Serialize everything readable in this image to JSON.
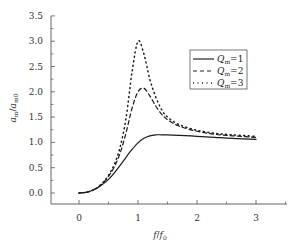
{
  "chart_data": {
    "type": "line",
    "title": "",
    "xlabel": "f/f0",
    "ylabel": "a_m/a_m0",
    "xlim": [
      -0.45,
      3.5
    ],
    "ylim": [
      -0.22,
      3.5
    ],
    "x_ticks": [
      0,
      1,
      2,
      3
    ],
    "x_tick_labels": [
      "0",
      "1",
      "2",
      "3"
    ],
    "y_ticks": [
      0.0,
      0.5,
      1.0,
      1.5,
      2.0,
      2.5,
      3.0,
      3.5
    ],
    "y_tick_labels": [
      "0.0",
      "0.5",
      "1.0",
      "1.5",
      "2.0",
      "2.5",
      "3.0",
      "3.5"
    ],
    "grid": false,
    "legend_position": "upper right",
    "x": [
      0,
      0.1,
      0.2,
      0.3,
      0.4,
      0.5,
      0.6,
      0.7,
      0.8,
      0.9,
      1.0,
      1.1,
      1.2,
      1.3,
      1.4,
      1.5,
      1.7,
      2.0,
      2.3,
      2.6,
      3.0
    ],
    "series": [
      {
        "name": "Q_m=1",
        "style": "solid",
        "values": [
          0.0,
          0.01,
          0.04,
          0.09,
          0.17,
          0.27,
          0.4,
          0.55,
          0.71,
          0.86,
          0.99,
          1.08,
          1.13,
          1.15,
          1.15,
          1.15,
          1.14,
          1.12,
          1.1,
          1.08,
          1.06
        ]
      },
      {
        "name": "Q_m=2",
        "style": "dashed",
        "values": [
          0.0,
          0.01,
          0.04,
          0.1,
          0.19,
          0.33,
          0.52,
          0.8,
          1.2,
          1.68,
          2.0,
          2.07,
          1.92,
          1.72,
          1.56,
          1.45,
          1.32,
          1.22,
          1.16,
          1.13,
          1.1
        ]
      },
      {
        "name": "Q_m=3",
        "style": "dotted",
        "values": [
          0.0,
          0.01,
          0.04,
          0.1,
          0.2,
          0.35,
          0.57,
          0.92,
          1.5,
          2.4,
          3.0,
          2.75,
          2.25,
          1.9,
          1.65,
          1.5,
          1.35,
          1.24,
          1.18,
          1.15,
          1.12
        ]
      }
    ]
  },
  "legend": {
    "items": [
      {
        "label": "=1",
        "sym": "Q",
        "sub": "m"
      },
      {
        "label": "=2",
        "sym": "Q",
        "sub": "m"
      },
      {
        "label": "=3",
        "sym": "Q",
        "sub": "m"
      }
    ]
  },
  "axes": {
    "xlabel_main": "f",
    "xlabel_slash": "/",
    "xlabel_denom": "f",
    "xlabel_denom_sub": "0",
    "ylabel_num": "a",
    "ylabel_num_sub": "m",
    "ylabel_denom": "a",
    "ylabel_denom_sub": "m0"
  }
}
